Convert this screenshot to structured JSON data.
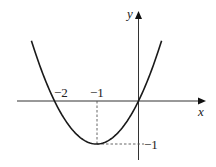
{
  "chart_data": {
    "type": "line",
    "title": "",
    "function": "y = x^2 + 2x",
    "xlabel": "x",
    "ylabel": "y",
    "x_ticks": [
      {
        "value": -2,
        "label": "−2"
      },
      {
        "value": -1,
        "label": "−1"
      }
    ],
    "y_ticks": [
      {
        "value": -1,
        "label": "−1"
      }
    ],
    "series": [
      {
        "name": "parabola",
        "x": [
          -2.55,
          -2.5,
          -2.25,
          -2,
          -1.75,
          -1.5,
          -1.25,
          -1,
          -0.75,
          -0.5,
          -0.25,
          0,
          0.25,
          0.5,
          0.55
        ],
        "y": [
          1.4025,
          1.25,
          0.5625,
          0,
          -0.4375,
          -0.75,
          -0.9375,
          -1,
          -0.9375,
          -0.75,
          -0.4375,
          0,
          0.5625,
          1.25,
          1.4025
        ]
      }
    ],
    "annotations": [
      {
        "type": "vertex",
        "x": -1,
        "y": -1,
        "dashed_guides": true
      },
      {
        "type": "root",
        "x": -2,
        "y": 0
      },
      {
        "type": "root",
        "x": 0,
        "y": 0
      }
    ],
    "xlim": [
      -2.9,
      1.6
    ],
    "ylim": [
      -1.4,
      2.1
    ],
    "grid": false,
    "legend": "none"
  },
  "axes": {
    "x_label": "x",
    "y_label": "y",
    "tick_minus2": "−2",
    "tick_minus1_x": "−1",
    "tick_minus1_y": "−1"
  },
  "style": {
    "curve_color": "#1a1a1a",
    "axis_color": "#333333",
    "guide_color": "#555555"
  }
}
